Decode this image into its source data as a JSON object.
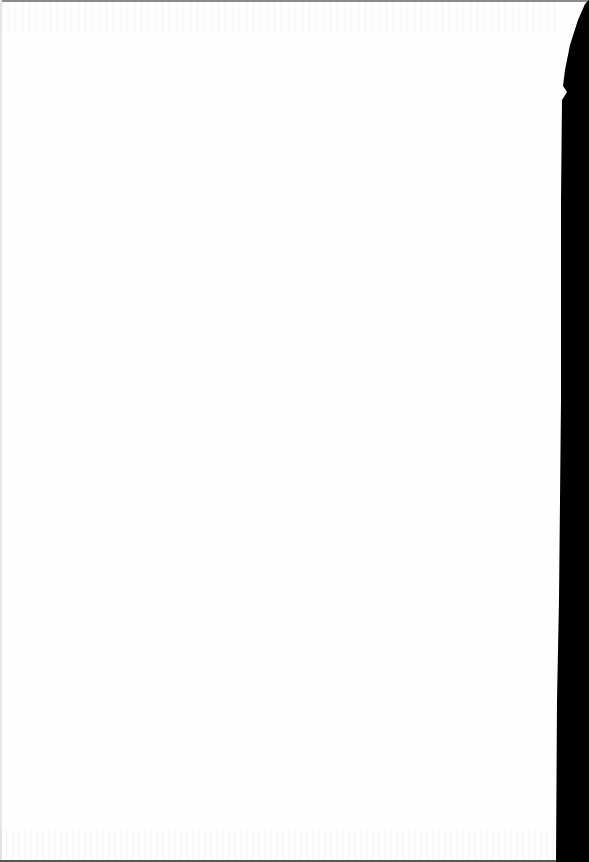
{
  "document": {
    "type": "blank scanned page",
    "content": "",
    "colors": {
      "paper": "#fefefe",
      "scan_edge": "#000000",
      "top_rule": "#8a8a8a"
    }
  }
}
